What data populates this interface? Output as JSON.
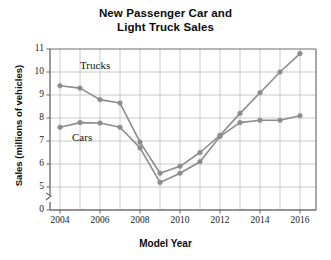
{
  "chart_data": {
    "type": "line",
    "title": "New Passenger Car and Light Truck Sales",
    "title_line1": "New Passenger Car and",
    "title_line2": "Light Truck Sales",
    "xlabel": "Model Year",
    "ylabel": "Sales (millions of vehicles)",
    "x": [
      2004,
      2005,
      2006,
      2007,
      2008,
      2009,
      2010,
      2011,
      2012,
      2013,
      2014,
      2015,
      2016
    ],
    "xticks": [
      "2004",
      "2006",
      "2008",
      "2010",
      "2012",
      "2014",
      "2016"
    ],
    "xtick_values": [
      2004,
      2006,
      2008,
      2010,
      2012,
      2014,
      2016
    ],
    "xlim": [
      2003.5,
      2016.8
    ],
    "yticks": [
      "0",
      "5",
      "6",
      "7",
      "8",
      "9",
      "10",
      "11"
    ],
    "ytick_values": [
      0,
      5,
      6,
      7,
      8,
      9,
      10,
      11
    ],
    "ylim": [
      5,
      11
    ],
    "y_axis_break": true,
    "grid": true,
    "legend": "inline-labels",
    "series": [
      {
        "name": "Trucks",
        "color": "#8c8c8c",
        "marker": "circle",
        "label_x": 2005.0,
        "label_y": 10.25,
        "values": [
          9.4,
          9.3,
          8.8,
          8.65,
          6.95,
          5.6,
          5.9,
          6.5,
          7.25,
          8.2,
          9.1,
          10.0,
          10.8
        ]
      },
      {
        "name": "Cars",
        "color": "#8c8c8c",
        "marker": "circle",
        "label_x": 2004.6,
        "label_y": 7.15,
        "values": [
          7.6,
          7.8,
          7.78,
          7.6,
          6.7,
          5.2,
          5.6,
          6.1,
          7.2,
          7.8,
          7.9,
          7.9,
          8.1
        ]
      }
    ]
  },
  "colors": {
    "series": "#8c8c8c",
    "axis": "#6f6f6f",
    "grid": "#bdbdbd",
    "text": "#0b0b0b",
    "background": "#ffffff"
  }
}
